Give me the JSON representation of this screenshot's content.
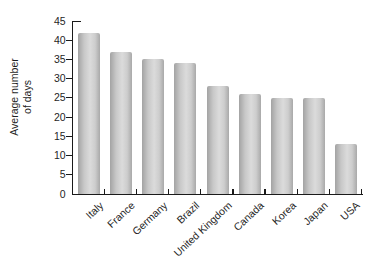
{
  "chart_data": {
    "type": "bar",
    "title": "",
    "xlabel": "",
    "ylabel": "Average number of days",
    "ylabel_lines": [
      "Average number",
      "of days"
    ],
    "categories": [
      "Italy",
      "France",
      "Germany",
      "Brazil",
      "United Kingdom",
      "Canada",
      "Korea",
      "Japan",
      "USA"
    ],
    "values": [
      42,
      37,
      35,
      34,
      28,
      26,
      25,
      25,
      13
    ],
    "ylim": [
      0,
      45
    ],
    "ytick_step": 5,
    "yticks": [
      0,
      5,
      10,
      15,
      20,
      25,
      30,
      35,
      40,
      45
    ],
    "grid": false,
    "legend": false,
    "bar_style": "cylindrical-gray-gradient",
    "x_label_rotation_deg": -43
  },
  "colors": {
    "background": "#ffffff",
    "axis": "#1a1a1a",
    "text": "#1f1f1f",
    "bar_gradient": [
      "#a3a3a3",
      "#c8c8c8",
      "#dbdbdb",
      "#cdcdcd",
      "#a9a9a9"
    ]
  }
}
